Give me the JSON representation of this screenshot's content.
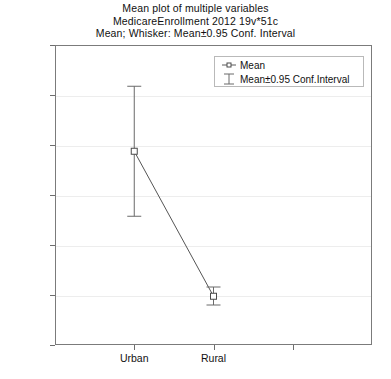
{
  "chart_data": {
    "type": "scatter",
    "title": "Mean plot of multiple variables",
    "subtitle": "MedicareEnrollment 2012 19v*51c",
    "subtitle2": "Mean; Whisker: Mean±0.95 Conf. Interval",
    "title_lines": [
      "Mean plot of multiple variables",
      "MedicareEnrollment 2012 19v*51c",
      "Mean; Whisker: Mean±0.95 Conf. Interval"
    ],
    "xlabel": "",
    "ylabel": "",
    "categories": [
      "Urban",
      "Rural"
    ],
    "values": [
      775000,
      195000
    ],
    "errors_low": [
      515000,
      160000
    ],
    "errors_high": [
      1035000,
      232000
    ],
    "points": [
      {
        "category": "Urban",
        "mean": 775000,
        "ci_low": 515000,
        "ci_high": 1035000
      },
      {
        "category": "Rural",
        "mean": 195000,
        "ci_low": 160000,
        "ci_high": 232000
      }
    ],
    "ylim": [
      0,
      1200000
    ],
    "ytick_values": [
      0,
      200000,
      400000,
      600000,
      800000,
      1000000,
      1200000
    ],
    "ytick_labels": [
      "0",
      "2E5",
      "4E5",
      "6E5",
      "8E5",
      "1E6",
      "1.2E6"
    ],
    "grid": true,
    "grid_axis": "y",
    "legend_position": "top-right-inside",
    "legend": [
      {
        "label": "Mean",
        "marker": "square-point-icon"
      },
      {
        "label": "Mean±0.95 Conf.Interval",
        "marker": "i-beam-whisker-icon"
      }
    ],
    "colors": {
      "marker_stroke": "#4a4a4a",
      "marker_fill": "#ffffff",
      "line": "#555555",
      "whisker": "#6a6a6a",
      "frame": "#7b7b7b",
      "grid": "#ededed",
      "text": "#111111",
      "background": "#ffffff"
    }
  }
}
